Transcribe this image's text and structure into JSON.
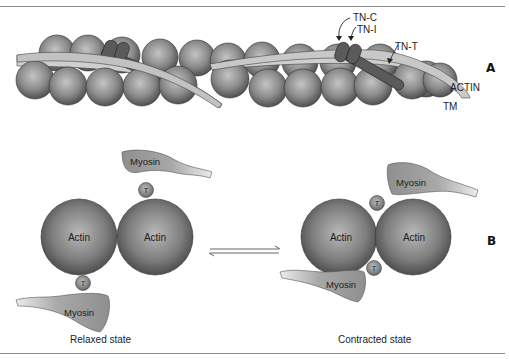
{
  "caption_fragment": "...ng... ... ...p...",
  "panel_a": {
    "label": "A",
    "annotations": {
      "tn_c": "TN-C",
      "tn_i": "TN-I",
      "tn_t": "TN-T",
      "actin": "ACTIN",
      "tm": "TM"
    }
  },
  "panel_b": {
    "label": "B",
    "relaxed": {
      "caption": "Relaxed state",
      "actin_left": "Actin",
      "actin_right": "Actin",
      "myosin_top": "Myosin",
      "myosin_bottom": "Myosin",
      "t_top": "T",
      "t_bottom": "T"
    },
    "contracted": {
      "caption": "Contracted state",
      "actin_left": "Actin",
      "actin_right": "Actin",
      "myosin_top": "Myosin",
      "myosin_bottom": "Myosin",
      "t_top": "T",
      "t_bottom": "T"
    },
    "equilibrium_symbol": "⇌"
  },
  "colors": {
    "sphere_light": "#b5b5b5",
    "sphere_dark": "#555555",
    "troponin": "#5a5a5a",
    "tropomyosin": "#cfcfcf",
    "myosin_light": "#e6e6e6",
    "myosin_dark": "#9a9a9a",
    "rule": "#8a8a8a"
  }
}
